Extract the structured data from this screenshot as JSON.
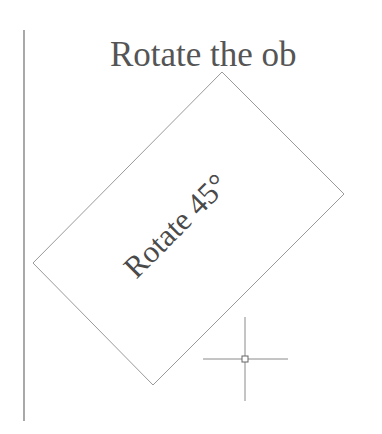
{
  "canvas": {
    "heading_text": "Rotate the ob",
    "rotated_object": {
      "label": "Rotate 45°",
      "rotation_deg": 45,
      "shape": "rectangle"
    },
    "cursor": {
      "type": "crosshair-pickbox"
    },
    "colors": {
      "background": "#ffffff",
      "line": "#8a8a8a",
      "text": "#555555"
    }
  }
}
